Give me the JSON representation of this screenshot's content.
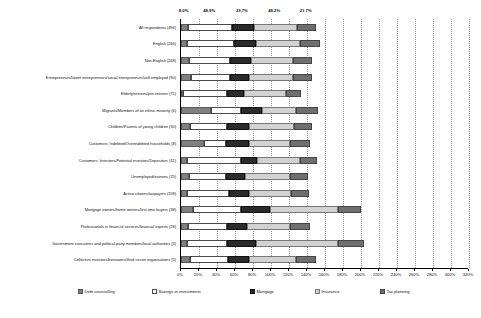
{
  "chart_data": {
    "type": "bar",
    "orientation": "horizontal",
    "stacked": true,
    "title": "",
    "xlabel": "",
    "ylabel": "",
    "xlim": [
      0,
      320
    ],
    "grid": true,
    "legend_position": "bottom",
    "xticks": [
      "0%",
      "20%",
      "40%",
      "60%",
      "80%",
      "100%",
      "120%",
      "140%",
      "160%",
      "180%",
      "200%",
      "220%",
      "240%",
      "260%",
      "280%",
      "300%",
      "320%"
    ],
    "xtick_values": [
      0,
      20,
      40,
      60,
      80,
      100,
      120,
      140,
      160,
      180,
      200,
      220,
      240,
      260,
      280,
      300,
      320
    ],
    "categories": [
      "All respondents (494)",
      "English (246)",
      "Non-English (248)",
      "Entrepreneurs/latent entrepreneurs/social entrepreneurs/self-employed (90)",
      "Elderly/retirees/pre-retirees (71)",
      "Migrants/Members of an ethnic minority (6)",
      "Children/Parents of young children (30)",
      "Customers: Indebted/Overindebted households (8)",
      "Customers: Investors/Potential investors/Depositors (31)",
      "Unemployed/trainees (25)",
      "Active citizens/taxpayers (158)",
      "Mortgage owners/home owners/first-time buyers (38)",
      "Professionals in financial services/financial experts (28)",
      "Government executives and political-party members/local authorities (3)",
      "Collective investors/borrowers/third sector organisations (5)"
    ],
    "series": [
      {
        "name": "Debt counselling",
        "values": [
          8.0,
          6.5,
          9.3,
          11.0,
          2.5,
          33.0,
          10.5,
          25.0,
          7.0,
          8.5,
          6.5,
          13.0,
          7.5,
          7.0,
          10.0
        ]
      },
      {
        "name": "Savings or investments",
        "values": [
          48.9,
          52.0,
          45.5,
          44.0,
          49.0,
          34.0,
          41.0,
          25.0,
          60.0,
          41.0,
          47.0,
          54.0,
          44.0,
          44.0,
          42.0
        ]
      },
      {
        "name": "Mortgage",
        "values": [
          23.7,
          25.0,
          22.5,
          21.0,
          18.0,
          23.0,
          24.0,
          25.0,
          18.0,
          22.0,
          22.0,
          32.0,
          22.0,
          32.0,
          24.0
        ]
      },
      {
        "name": "Insurance",
        "values": [
          48.2,
          49.0,
          47.5,
          48.0,
          47.0,
          38.0,
          50.0,
          46.0,
          47.0,
          50.0,
          47.0,
          75.0,
          48.0,
          92.0,
          52.0
        ]
      },
      {
        "name": "Tax planning",
        "values": [
          21.7,
          22.0,
          21.0,
          22.0,
          17.0,
          24.0,
          20.0,
          22.0,
          19.0,
          20.0,
          20.0,
          26.0,
          22.0,
          28.0,
          22.0
        ]
      }
    ],
    "top_data_labels": [
      {
        "text": "8,0%",
        "value": 8.0
      },
      {
        "text": "48,9%",
        "value": 48.9
      },
      {
        "text": "23,7%",
        "value": 23.7
      },
      {
        "text": "48,2%",
        "value": 48.2
      },
      {
        "text": "21,7%",
        "value": 21.7
      }
    ]
  },
  "legend": {
    "items": [
      {
        "label": "Debt counselling"
      },
      {
        "label": "Savings or investments"
      },
      {
        "label": "Mortgage"
      },
      {
        "label": "Insurance"
      },
      {
        "label": "Tax planning"
      }
    ]
  },
  "colors": {
    "debt_counselling": "#808080",
    "savings_or_investments": "#ffffff",
    "mortgage": "#2b2b2b",
    "insurance": "#d2d2d2",
    "tax_planning": "#6f6f6f",
    "axis": "#000000",
    "grid": "#9a9a9a"
  }
}
